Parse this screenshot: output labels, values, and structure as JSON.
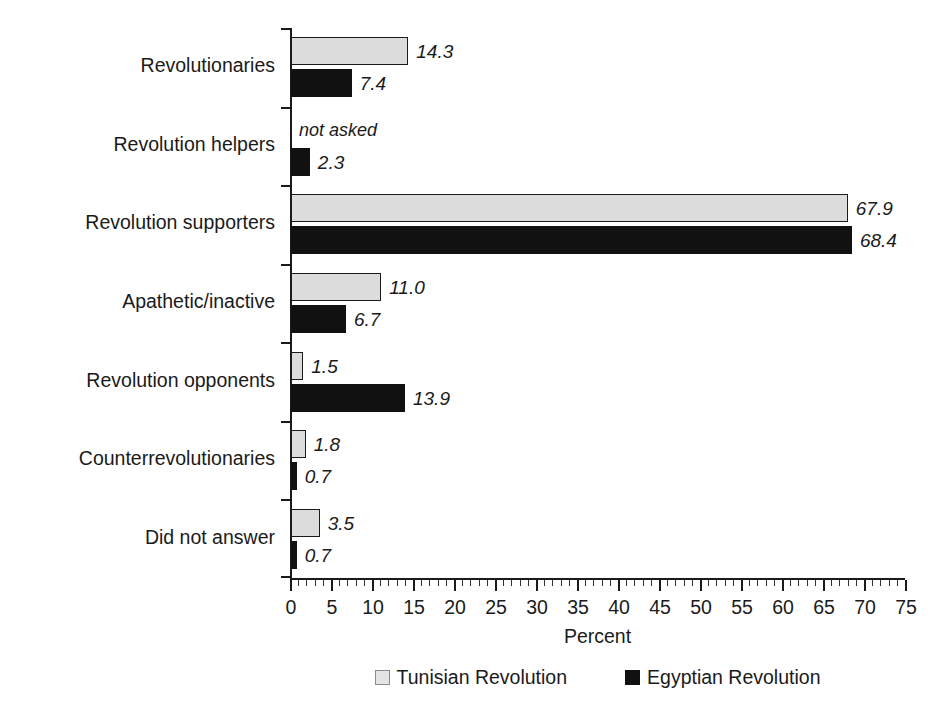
{
  "chart_data": {
    "type": "bar",
    "orientation": "horizontal",
    "title": "",
    "xlabel": "Percent",
    "ylabel": "",
    "xlim": [
      0,
      75
    ],
    "xticks": [
      0,
      5,
      10,
      15,
      20,
      25,
      30,
      35,
      40,
      45,
      50,
      55,
      60,
      65,
      70,
      75
    ],
    "minor_tick_step": 1,
    "grid": false,
    "legend_position": "bottom",
    "categories": [
      "Revolutionaries",
      "Revolution helpers",
      "Revolution supporters",
      "Apathetic/inactive",
      "Revolution opponents",
      "Counterrevolutionaries",
      "Did not answer"
    ],
    "series": [
      {
        "name": "Tunisian Revolution",
        "color": "#dcdcdc",
        "edge_color": "#1a1a1a",
        "values": [
          14.3,
          null,
          67.9,
          11.0,
          1.5,
          1.8,
          3.5
        ],
        "labels": [
          "14.3",
          "not asked",
          "67.9",
          "11.0",
          "1.5",
          "1.8",
          "3.5"
        ]
      },
      {
        "name": "Egyptian Revolution",
        "color": "#111111",
        "edge_color": "#111111",
        "values": [
          7.4,
          2.3,
          68.4,
          6.7,
          13.9,
          0.7,
          0.7
        ],
        "labels": [
          "7.4",
          "2.3",
          "68.4",
          "6.7",
          "13.9",
          "0.7",
          "0.7"
        ]
      }
    ]
  },
  "axis": {
    "x_title": "Percent"
  },
  "legend": {
    "items": [
      {
        "label": "Tunisian Revolution",
        "swatch": "light"
      },
      {
        "label": "Egyptian Revolution",
        "swatch": "dark"
      }
    ]
  }
}
